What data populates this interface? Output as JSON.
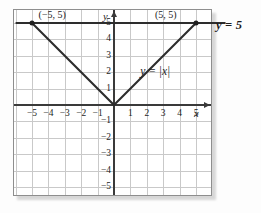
{
  "chart_data": {
    "type": "line",
    "title": "",
    "xlabel": "x",
    "ylabel": "y",
    "xlim": [
      -6,
      6
    ],
    "ylim": [
      -6,
      6
    ],
    "grid": true,
    "legend": "none",
    "x_ticks": [
      "-5",
      "-4",
      "-3",
      "-2",
      "-1",
      "1",
      "2",
      "3",
      "4",
      "5"
    ],
    "y_ticks": [
      "5",
      "4",
      "3",
      "2",
      "1",
      "-1",
      "-2",
      "-3",
      "-4",
      "-5"
    ],
    "series": [
      {
        "name": "y = |x|",
        "equation": "y = |x|",
        "type": "line",
        "points": [
          [
            -5,
            5
          ],
          [
            0,
            0
          ],
          [
            5,
            5
          ]
        ]
      },
      {
        "name": "y = 5",
        "equation": "y = 5",
        "type": "line",
        "points": [
          [
            -6,
            5
          ],
          [
            6.8,
            5
          ]
        ]
      }
    ],
    "intersections": [
      {
        "label": "(−5, 5)",
        "x": -5,
        "y": 5
      },
      {
        "label": "(5, 5)",
        "x": 5,
        "y": 5
      }
    ],
    "annotations": {
      "left_point": "(−5, 5)",
      "right_point": "(5, 5)",
      "abs_curve": "y = |x|",
      "horizontal_line": "y = 5"
    }
  },
  "axes": {
    "x_name": "x",
    "y_name": "y",
    "x_ticks": [
      {
        "label": "−5",
        "value": -5
      },
      {
        "label": "−4",
        "value": -4
      },
      {
        "label": "−3",
        "value": -3
      },
      {
        "label": "−2",
        "value": -2
      },
      {
        "label": "−1",
        "value": -1
      },
      {
        "label": "1",
        "value": 1
      },
      {
        "label": "2",
        "value": 2
      },
      {
        "label": "3",
        "value": 3
      },
      {
        "label": "4",
        "value": 4
      },
      {
        "label": "5",
        "value": 5
      }
    ],
    "y_ticks": [
      {
        "label": "5",
        "value": 5
      },
      {
        "label": "4",
        "value": 4
      },
      {
        "label": "3",
        "value": 3
      },
      {
        "label": "2",
        "value": 2
      },
      {
        "label": "1",
        "value": 1
      },
      {
        "label": "−1",
        "value": -1
      },
      {
        "label": "−2",
        "value": -2
      },
      {
        "label": "−3",
        "value": -3
      },
      {
        "label": "−4",
        "value": -4
      },
      {
        "label": "−5",
        "value": -5
      }
    ]
  },
  "colors": {
    "curve": "#2d2d2d",
    "axis": "#3a3a3a",
    "grid": "#c9c9c9",
    "frame": "#8e8e8e",
    "background": "#ffffff"
  }
}
